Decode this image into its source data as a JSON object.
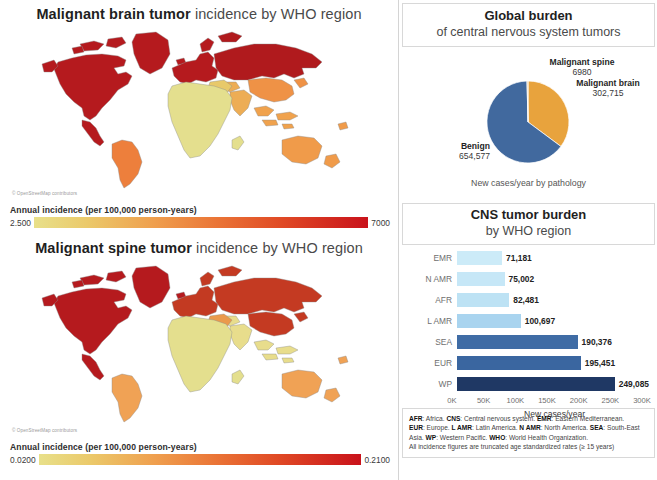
{
  "maps": [
    {
      "title_bold": "Malignant brain tumor",
      "title_rest": " incidence by WHO  region",
      "attribution": "© OpenStreetMap contributors",
      "legend_label": "Annual incidence (per 100,000 person-years)",
      "legend_min": "2.500",
      "legend_max": "7000"
    },
    {
      "title_bold": "Malignant spine tumor",
      "title_rest": " incidence by WHO  region",
      "attribution": "© OpenStreetMap contributors",
      "legend_label": "Annual incidence (per 100,000 person-years)",
      "legend_min": "0.0200",
      "legend_max": "0.2100"
    }
  ],
  "pie_panel": {
    "title": "Global burden",
    "subtitle": "of central nervous system tumors",
    "caption": "New cases/year by pathology",
    "labels": {
      "spine_name": "Malignant spine",
      "spine_value": "6980",
      "brain_name": "Malignant brain",
      "brain_value": "302,715",
      "benign_name": "Benign",
      "benign_value": "654,577"
    }
  },
  "bar_panel": {
    "title": "CNS tumor burden",
    "subtitle": "by WHO region",
    "axis_title": "New cases/year"
  },
  "footnote": {
    "line1_a": "AFR",
    "line1_b": ": Africa. ",
    "line1_c": "CNS",
    "line1_d": ": Central nervous system. ",
    "line1_e": "EMR",
    "line1_f": ": Eastern Mediterranean. ",
    "line2_a": "EUR",
    "line2_b": ": Europe. ",
    "line2_c": "L AMR",
    "line2_d": ": Latin America. ",
    "line2_e": "N AMR",
    "line2_f": ": North America. ",
    "line2_g": "SEA",
    "line2_h": ": South-East Asia. ",
    "line3_a": "WP",
    "line3_b": ": Western Pacific. ",
    "line3_c": "WHO",
    "line3_d": ": World Health Organization.",
    "line4": "All incidence figures are truncated age standardized rates (≥ 15 years)"
  },
  "colors": {
    "pie_benign": "#41699e",
    "pie_brain": "#e8a33d",
    "pie_spine": "#e8a33d",
    "bar_light": "#c9e8f7",
    "bar_dark": "#1f3864",
    "grad_low": "#e8e08a",
    "grad_high": "#c9121b",
    "map_low": "#e8e08a",
    "map_high": "#b51a1e"
  },
  "chart_data": [
    {
      "type": "pie",
      "title": "Global burden",
      "subtitle": "of central nervous system tumors",
      "caption": "New cases/year by pathology",
      "labels": [
        "Benign",
        "Malignant brain",
        "Malignant spine"
      ],
      "values": [
        654577,
        302715,
        6980
      ],
      "colors": [
        "#41699e",
        "#e8a33d",
        "#e8a33d"
      ],
      "legend_position": "callout-labels"
    },
    {
      "type": "bar",
      "orientation": "horizontal",
      "title": "CNS tumor burden",
      "subtitle": "by WHO region",
      "categories": [
        "EMR",
        "N AMR",
        "AFR",
        "L AMR",
        "SEA",
        "EUR",
        "WP"
      ],
      "values": [
        71181,
        75002,
        82481,
        100697,
        190376,
        195451,
        249085
      ],
      "value_labels": [
        "71,181",
        "75,002",
        "82,481",
        "100,697",
        "190,376",
        "195,451",
        "249,085"
      ],
      "bar_colors": [
        "#ccebf8",
        "#c6e7f7",
        "#bde2f4",
        "#a9d4ef",
        "#3f6ca5",
        "#3a66a0",
        "#1f3864"
      ],
      "xlabel": "New cases/year",
      "ylabel": "",
      "xlim": [
        0,
        300000
      ],
      "xticks": [
        0,
        50000,
        100000,
        150000,
        200000,
        250000,
        300000
      ],
      "xtick_labels": [
        "0K",
        "50K",
        "100K",
        "150K",
        "200K",
        "250K",
        "300K"
      ],
      "grid": false,
      "legend_position": "none"
    },
    {
      "type": "heatmap",
      "subtype": "choropleth-map",
      "title": "Malignant brain tumor incidence by WHO region",
      "colorbar_label": "Annual incidence (per 100,000 person-years)",
      "vmin": 2.5,
      "vmax": 7000,
      "vmin_label": "2.500",
      "vmax_label": "7000",
      "cmap": "YlOrRd",
      "region_values": [
        {
          "region": "North America",
          "level": "high"
        },
        {
          "region": "Greenland",
          "level": "high"
        },
        {
          "region": "Europe",
          "level": "high"
        },
        {
          "region": "Russia / Central Asia",
          "level": "high"
        },
        {
          "region": "China / East Asia",
          "level": "mid-high"
        },
        {
          "region": "South America",
          "level": "mid"
        },
        {
          "region": "Australia",
          "level": "mid"
        },
        {
          "region": "South Asia",
          "level": "mid"
        },
        {
          "region": "Africa",
          "level": "low"
        }
      ]
    },
    {
      "type": "heatmap",
      "subtype": "choropleth-map",
      "title": "Malignant spine tumor incidence by WHO region",
      "colorbar_label": "Annual incidence (per 100,000 person-years)",
      "vmin": 0.02,
      "vmax": 0.21,
      "vmin_label": "0.0200",
      "vmax_label": "0.2100",
      "cmap": "YlOrRd",
      "region_values": [
        {
          "region": "North America",
          "level": "high"
        },
        {
          "region": "Greenland",
          "level": "mid-high"
        },
        {
          "region": "Europe",
          "level": "high"
        },
        {
          "region": "Russia / Central Asia",
          "level": "high"
        },
        {
          "region": "China / East Asia",
          "level": "high"
        },
        {
          "region": "South America",
          "level": "mid"
        },
        {
          "region": "Australia",
          "level": "mid"
        },
        {
          "region": "South Asia",
          "level": "low-mid"
        },
        {
          "region": "Africa",
          "level": "low"
        }
      ]
    }
  ]
}
